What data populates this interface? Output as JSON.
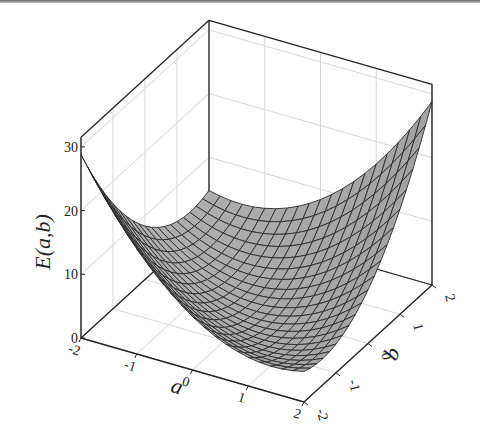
{
  "chart_data": {
    "type": "surface3d",
    "title": "",
    "function_approx": "E(a,b) ≈ 1.8(a+b)^2 + 0.3(a-b)^2",
    "xlabel": "a",
    "ylabel": "b",
    "zlabel": "E(a,b)",
    "xlim": [
      -2,
      2
    ],
    "ylim": [
      -2,
      2
    ],
    "zlim": [
      0,
      31.5
    ],
    "xticks": [
      -2,
      -1,
      0,
      1,
      2
    ],
    "yticks": [
      -2,
      -1,
      0,
      1,
      2
    ],
    "zticks": [
      0,
      10,
      20,
      30
    ],
    "xtick_labels": [
      "-2",
      "-1",
      "0",
      "1",
      "2"
    ],
    "ytick_labels": [
      "-2",
      "-1",
      "0",
      "1",
      "2"
    ],
    "ztick_labels": [
      "0",
      "10",
      "20",
      "30"
    ],
    "grid": true,
    "mesh_divisions": 20,
    "corner_values": [
      {
        "a": -2,
        "b": -2,
        "E": 30.5
      },
      {
        "a": 2,
        "b": -2,
        "E": 4.5
      },
      {
        "a": -2,
        "b": 2,
        "E": 6
      },
      {
        "a": 2,
        "b": 2,
        "E": 28
      }
    ],
    "surface_color": "#a8a8a8",
    "edge_color": "#2a2a2a",
    "grid_color": "#d6d6d6",
    "box_color": "#222222"
  }
}
